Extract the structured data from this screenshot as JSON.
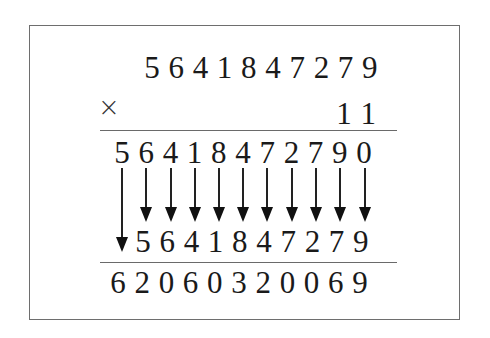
{
  "diagram": {
    "type": "long-multiplication",
    "operator_symbol": "×",
    "multiplicand": "5641847279",
    "multiplier": "11",
    "shifted_partial": "56418472790",
    "partial": "5641847279",
    "result": "62060320069",
    "rows": [
      {
        "name": "multiplicand",
        "digits": [
          "5",
          "6",
          "4",
          "1",
          "8",
          "4",
          "7",
          "2",
          "7",
          "9"
        ],
        "start_x": 152,
        "top": 52
      },
      {
        "name": "multiplier",
        "digits": [
          "1",
          "1"
        ],
        "start_x": 344,
        "top": 98
      },
      {
        "name": "shifted-partial",
        "digits": [
          "5",
          "6",
          "4",
          "1",
          "8",
          "4",
          "7",
          "2",
          "7",
          "9",
          "0"
        ],
        "start_x": 122,
        "top": 137
      },
      {
        "name": "partial",
        "digits": [
          "5",
          "6",
          "4",
          "1",
          "8",
          "4",
          "7",
          "2",
          "7",
          "9"
        ],
        "start_x": 143,
        "top": 226
      },
      {
        "name": "result",
        "digits": [
          "6",
          "2",
          "0",
          "6",
          "0",
          "3",
          "2",
          "0",
          "0",
          "6",
          "9"
        ],
        "start_x": 118,
        "top": 267
      }
    ],
    "digit_spacing": 24.2,
    "rules_y": [
      130,
      262
    ],
    "arrows": {
      "long": {
        "x": 122,
        "from_y": 168,
        "to_y": 252
      },
      "short": {
        "xs": [
          146,
          171,
          195,
          219,
          243,
          267,
          292,
          316,
          340,
          365
        ],
        "from_y": 168,
        "to_y": 222
      }
    }
  }
}
